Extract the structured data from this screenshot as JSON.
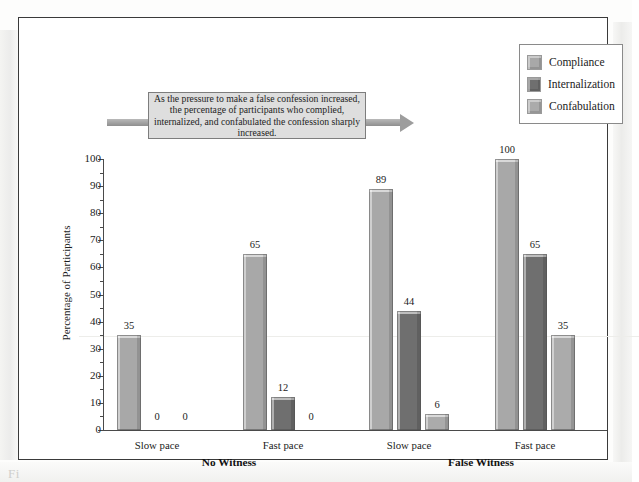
{
  "figure": {
    "callout_text": "As the pressure to make a false confession increased, the percentage of participants who complied, internalized, and confabulated the confession sharply increased.",
    "caption_ghost": "Fi"
  },
  "legend": {
    "items": [
      {
        "label": "Compliance",
        "color": "#a8a8a8"
      },
      {
        "label": "Internalization",
        "color": "#6f6f6f"
      },
      {
        "label": "Confabulation",
        "color": "#ababab"
      }
    ]
  },
  "chart_data": {
    "type": "bar",
    "title": "",
    "xlabel": "",
    "ylabel": "Percentage of Participants",
    "ylim": [
      0,
      100
    ],
    "ytick_step": 10,
    "yminor_step": 5,
    "grid": false,
    "legend_position": "top-right",
    "ytick_labels": [
      "0",
      "10",
      "20",
      "30",
      "40",
      "50",
      "60",
      "70",
      "80",
      "90",
      "100"
    ],
    "categories": [
      "Slow pace",
      "Fast pace",
      "Slow pace",
      "Fast pace"
    ],
    "group_labels": [
      "No Witness",
      "False Witness"
    ],
    "groups": [
      {
        "condition": "No Witness",
        "pace": "Slow pace",
        "values": [
          35,
          0,
          0
        ]
      },
      {
        "condition": "No Witness",
        "pace": "Fast pace",
        "values": [
          65,
          12,
          0
        ]
      },
      {
        "condition": "False Witness",
        "pace": "Slow pace",
        "values": [
          89,
          44,
          6
        ]
      },
      {
        "condition": "False Witness",
        "pace": "Fast pace",
        "values": [
          100,
          65,
          35
        ]
      }
    ],
    "series": [
      {
        "name": "Compliance",
        "values": [
          35,
          65,
          89,
          100
        ],
        "color": "#a8a8a8"
      },
      {
        "name": "Internalization",
        "values": [
          0,
          12,
          44,
          65
        ],
        "color": "#6f6f6f"
      },
      {
        "name": "Confabulation",
        "values": [
          0,
          0,
          6,
          35
        ],
        "color": "#ababab"
      }
    ]
  }
}
